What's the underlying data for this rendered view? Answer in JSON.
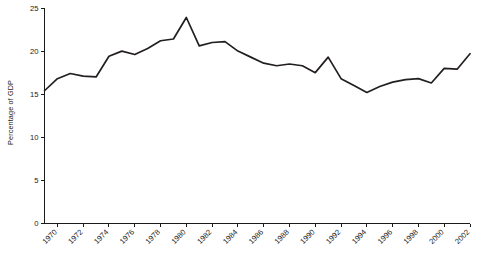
{
  "chart_data": {
    "type": "line",
    "title": "",
    "subtitle": "",
    "xlabel": "",
    "ylabel": "Percentage of GDP",
    "xlim": [
      1969,
      2002
    ],
    "ylim": [
      0,
      25
    ],
    "grid": false,
    "legend": null,
    "yticks": [
      0,
      5,
      10,
      15,
      20,
      25
    ],
    "ytick_labels": [
      "0",
      "5",
      "10",
      "15",
      "20",
      "25"
    ],
    "xticks": [
      1970,
      1972,
      1974,
      1976,
      1978,
      1980,
      1982,
      1984,
      1986,
      1988,
      1990,
      1992,
      1994,
      1996,
      1998,
      2000,
      2002
    ],
    "xtick_labels": [
      "1970",
      "1972",
      "1974",
      "1976",
      "1978",
      "1980",
      "1982",
      "1984",
      "1986",
      "1988",
      "1990",
      "1992",
      "1994",
      "1996",
      "1998",
      "2000",
      "2002"
    ],
    "series": [
      {
        "name": "Percentage of GDP",
        "color": "#231f20",
        "x": [
          1969,
          1970,
          1971,
          1972,
          1973,
          1974,
          1975,
          1976,
          1977,
          1978,
          1979,
          1980,
          1981,
          1982,
          1983,
          1984,
          1985,
          1986,
          1987,
          1988,
          1989,
          1990,
          1991,
          1992,
          1993,
          1994,
          1995,
          1996,
          1997,
          1998,
          1999,
          2000,
          2001,
          2002
        ],
        "values": [
          15.4,
          16.8,
          17.4,
          17.1,
          17.0,
          19.4,
          20.0,
          19.6,
          20.3,
          21.2,
          21.4,
          23.9,
          20.6,
          21.0,
          21.1,
          20.0,
          19.3,
          18.6,
          18.3,
          18.5,
          18.3,
          17.5,
          19.3,
          16.8,
          16.0,
          15.2,
          15.9,
          16.4,
          16.7,
          16.8,
          16.3,
          18.0,
          17.9,
          19.7
        ]
      }
    ]
  },
  "axes": {
    "y_axis_name": "y-axis",
    "x_axis_name": "x-axis"
  }
}
